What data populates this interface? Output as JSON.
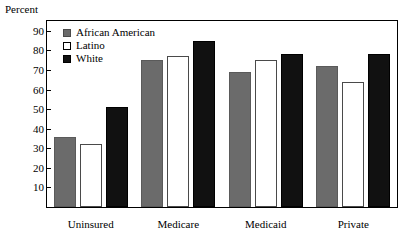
{
  "chart_data": {
    "type": "bar",
    "title": "",
    "xlabel": "",
    "ylabel": "Percent",
    "ylim": [
      0,
      95
    ],
    "yticks": [
      10,
      20,
      30,
      40,
      50,
      60,
      70,
      80,
      90
    ],
    "grid": false,
    "legend_position": "top-left",
    "categories": [
      "Uninsured",
      "Medicare",
      "Medicaid",
      "Private"
    ],
    "series": [
      {
        "name": "African American",
        "color": "#6b6b6b",
        "values": [
          36,
          75,
          69,
          72
        ]
      },
      {
        "name": "Latino",
        "color": "#ffffff",
        "values": [
          32,
          77,
          75,
          64
        ]
      },
      {
        "name": "White",
        "color": "#111111",
        "values": [
          51,
          85,
          78,
          78
        ]
      }
    ]
  },
  "axis": {
    "ylabel_text": "Percent"
  }
}
